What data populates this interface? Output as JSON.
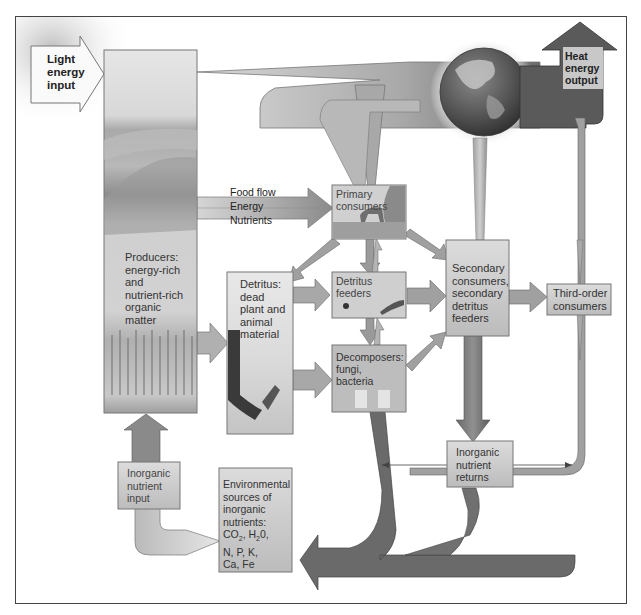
{
  "diagram": {
    "nodes": {
      "light_input": {
        "label": "Light energy input",
        "lines": [
          "Light",
          "energy",
          "input"
        ]
      },
      "heat_output": {
        "label": "Heat energy output",
        "lines": [
          "Heat",
          "energy",
          "output"
        ]
      },
      "producers": {
        "label": "Producers: energy-rich and nutrient-rich organic matter",
        "lines": [
          "Producers:",
          "energy-rich",
          "and",
          "nutrient-rich",
          "organic",
          "matter"
        ]
      },
      "primary_consumers": {
        "label": "Primary consumers",
        "lines": [
          "Primary",
          "consumers"
        ]
      },
      "detritus": {
        "label": "Detritus: dead plant and animal material",
        "lines": [
          "Detritus:",
          "dead",
          "plant and",
          "animal",
          "material"
        ]
      },
      "detritus_feeders": {
        "label": "Detritus feeders",
        "lines": [
          "Detritus",
          "feeders"
        ]
      },
      "decomposers": {
        "label": "Decomposers: fungi, bacteria",
        "lines": [
          "Decomposers:",
          "fungi,",
          "bacteria"
        ]
      },
      "secondary_consumers": {
        "label": "Secondary consumers, secondary detritus feeders",
        "lines": [
          "Secondary",
          "consumers,",
          "secondary",
          "detritus",
          "feeders"
        ]
      },
      "third_order": {
        "label": "Third-order consumers",
        "lines": [
          "Third-order",
          "consumers"
        ]
      },
      "inorganic_returns": {
        "label": "Inorganic nutrient returns",
        "lines": [
          "Inorganic",
          "nutrient",
          "returns"
        ]
      },
      "inorganic_input": {
        "label": "Inorganic nutrient input",
        "lines": [
          "Inorganic",
          "nutrient",
          "input"
        ]
      },
      "environmental_sources": {
        "label": "Environmental sources of inorganic nutrients: CO2, H20, N, P, K, Ca, Fe",
        "lines": [
          "Environmental",
          "sources of",
          "inorganic",
          "nutrients:",
          "CO",
          "2",
          ", H",
          "2",
          "0,",
          "N, P, K,",
          "Ca, Fe"
        ]
      }
    },
    "legend": {
      "food_flow": "Food flow",
      "energy": "Energy",
      "nutrients": "Nutrients"
    },
    "colors": {
      "box_fill": "#d4d4d4",
      "arrow_light": "#c8c8c8",
      "arrow_mid": "#9a9a9a",
      "arrow_dark": "#6e6e6e",
      "border": "#444444"
    }
  }
}
